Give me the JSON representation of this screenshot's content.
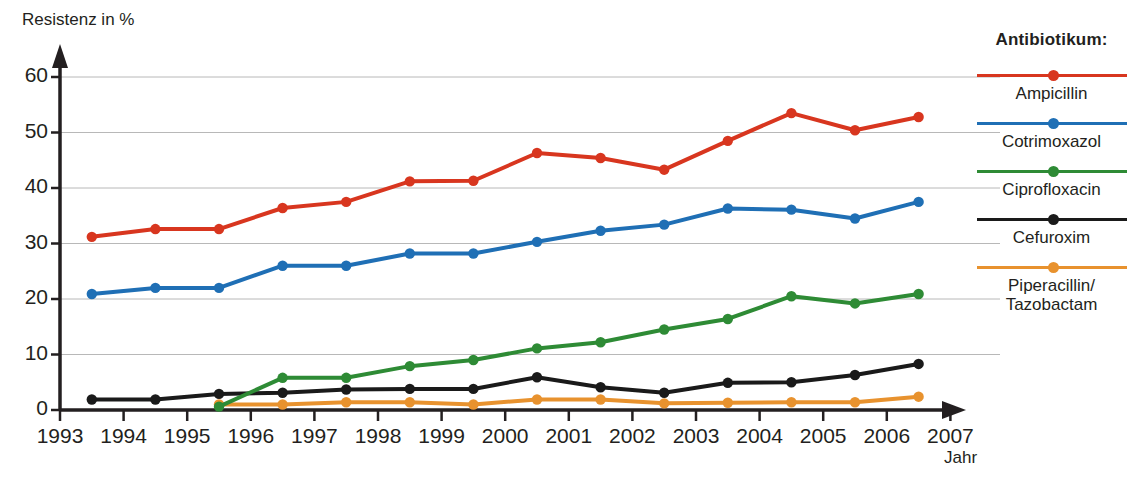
{
  "axes": {
    "ylabel": "Resistenz in %",
    "xlabel": "Jahr",
    "yticks": [
      "0",
      "10",
      "20",
      "30",
      "40",
      "50",
      "60"
    ],
    "xticks": [
      "1993",
      "1994",
      "1995",
      "1996",
      "1997",
      "1998",
      "1999",
      "2000",
      "2001",
      "2002",
      "2003",
      "2004",
      "2005",
      "2006",
      "2007"
    ]
  },
  "legend": {
    "title": "Antibiotikum:",
    "items": [
      {
        "label": "Ampicillin",
        "color": "#d8361f"
      },
      {
        "label": "Cotrimoxazol",
        "color": "#1f6fb5"
      },
      {
        "label": "Ciprofloxacin",
        "color": "#2e8b35"
      },
      {
        "label": "Cefuroxim",
        "color": "#1a1a1a"
      },
      {
        "label": "Piperacillin/\nTazobactam",
        "color": "#e8922e"
      }
    ]
  },
  "chart_data": {
    "type": "line",
    "title": "",
    "xlabel": "Jahr",
    "ylabel": "Resistenz in %",
    "xlim": [
      1993,
      2007
    ],
    "ylim": [
      0,
      63
    ],
    "yticks": [
      0,
      10,
      20,
      30,
      40,
      50,
      60
    ],
    "xticks": [
      1993,
      1994,
      1995,
      1996,
      1997,
      1998,
      1999,
      2000,
      2001,
      2002,
      2003,
      2004,
      2005,
      2006,
      2007
    ],
    "grid": "horizontal",
    "legend_position": "right",
    "x": [
      1993.5,
      1994.5,
      1995.5,
      1996.5,
      1997.5,
      1998.5,
      1999.5,
      2000.5,
      2001.5,
      2002.5,
      2003.5,
      2004.5,
      2005.5,
      2006.5
    ],
    "series": [
      {
        "name": "Ampicillin",
        "color": "#d8361f",
        "values": [
          31.2,
          32.6,
          32.6,
          36.4,
          37.5,
          41.2,
          41.3,
          46.3,
          45.4,
          43.3,
          48.5,
          53.5,
          50.4,
          52.8
        ]
      },
      {
        "name": "Cotrimoxazol",
        "color": "#1f6fb5",
        "values": [
          20.9,
          22.0,
          22.0,
          26.0,
          26.0,
          28.2,
          28.2,
          30.3,
          32.3,
          33.4,
          36.3,
          36.1,
          34.5,
          37.5
        ]
      },
      {
        "name": "Ciprofloxacin",
        "color": "#2e8b35",
        "values": [
          null,
          null,
          0.6,
          5.8,
          5.8,
          7.9,
          9.0,
          11.1,
          12.2,
          14.5,
          16.4,
          20.5,
          19.2,
          20.9
        ]
      },
      {
        "name": "Cefuroxim",
        "color": "#1a1a1a",
        "values": [
          1.9,
          1.9,
          2.9,
          3.1,
          3.7,
          3.8,
          3.8,
          5.9,
          4.1,
          3.1,
          4.9,
          5.0,
          6.3,
          8.3
        ]
      },
      {
        "name": "Piperacillin/Tazobactam",
        "color": "#e8922e",
        "values": [
          null,
          null,
          1.0,
          1.0,
          1.4,
          1.4,
          1.0,
          1.9,
          1.9,
          1.2,
          1.3,
          1.4,
          1.4,
          2.4
        ]
      }
    ]
  }
}
